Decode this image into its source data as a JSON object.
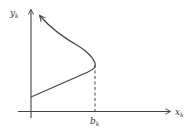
{
  "diagram": {
    "y_axis": {
      "label": "y",
      "subscript": "k"
    },
    "x_axis": {
      "label": "x",
      "subscript": "k"
    },
    "marker": {
      "label": "b",
      "subscript": "k"
    },
    "colors": {
      "stroke": "#444444",
      "text": "#333333",
      "background": "#ffffff"
    }
  }
}
